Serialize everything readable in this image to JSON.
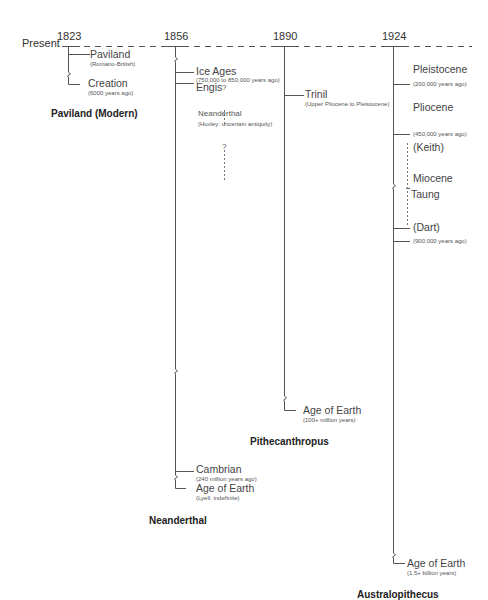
{
  "timeline": {
    "start_label": "Present",
    "years": [
      "1823",
      "1856",
      "1890",
      "1924"
    ]
  },
  "panels": [
    {
      "year": "1823",
      "title": "Paviland (Modern)",
      "entries": [
        {
          "label": "Paviland",
          "note": "(Romano-British)"
        },
        {
          "label": "Creation",
          "note": "(6000 years ago)"
        }
      ]
    },
    {
      "year": "1856",
      "title": "Neanderthal",
      "entries": [
        {
          "label": "Ice Ages",
          "note": "(750,000 to 850,000 years ago)"
        },
        {
          "label": "Engis",
          "note": ""
        },
        {
          "label": "Neanderthal",
          "note": "(Huxley: uncertain antiquity)"
        },
        {
          "label": "Cambrian",
          "note": "(240 million years ago)"
        },
        {
          "label": "Age of Earth",
          "note": "(Lyell: indefinite)"
        }
      ],
      "question_marks": [
        "?",
        "?"
      ]
    },
    {
      "year": "1890",
      "title": "Pithecanthropus",
      "entries": [
        {
          "label": "Trinil",
          "note": "(Upper Pliocene to Pleistocene)"
        },
        {
          "label": "Age of Earth",
          "note": "(100+ million years)"
        }
      ]
    },
    {
      "year": "1924",
      "title": "Australopithecus",
      "entries": [
        {
          "label": "Pleistocene",
          "note": ""
        },
        {
          "label": "",
          "note": "(200,000 years ago)"
        },
        {
          "label": "Pliocene",
          "note": ""
        },
        {
          "label": "",
          "note": "(450,000 years ago)"
        },
        {
          "label": "(Keith)",
          "note": ""
        },
        {
          "label": "Miocene",
          "note": ""
        },
        {
          "label": "Taung",
          "note": ""
        },
        {
          "label": "(Dart)",
          "note": ""
        },
        {
          "label": "",
          "note": "(900,000 years ago)"
        },
        {
          "label": "Age of Earth",
          "note": "(1.5+ billion years)"
        }
      ]
    }
  ],
  "colors": {
    "line": "#555555",
    "text": "#333333",
    "background": "#ffffff"
  }
}
